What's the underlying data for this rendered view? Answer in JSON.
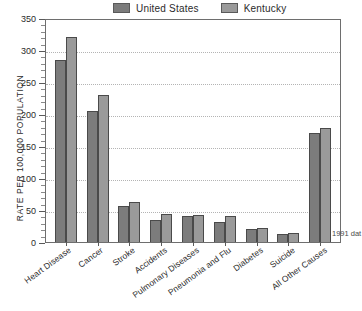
{
  "chart_data": {
    "type": "bar",
    "title": "",
    "subtitle": "",
    "xlabel": "",
    "ylabel": "RATE PER 100,000 POPULATION",
    "ylim": [
      0,
      350
    ],
    "ytick_step": 50,
    "yticks": [
      0,
      50,
      100,
      150,
      200,
      250,
      300,
      350
    ],
    "ytick_labels": [
      "0",
      "50",
      "100",
      "150",
      "200",
      "250",
      "300",
      "350"
    ],
    "grid": "horizontal-dotted",
    "legend_position": "top-center",
    "categories": [
      "Heart Disease",
      "Cancer",
      "Stroke",
      "Accidents",
      "Pulmonary Diseases",
      "Pneumonia and Flu",
      "Diabetes",
      "Suicide",
      "All Other Causes"
    ],
    "series": [
      {
        "name": "United States",
        "color": "#7c7c7c",
        "values": [
          285,
          205,
          56,
          35,
          40,
          32,
          20,
          12,
          170
        ]
      },
      {
        "name": "Kentucky",
        "color": "#9a9a9a",
        "values": [
          320,
          230,
          63,
          44,
          42,
          40,
          22,
          14,
          178
        ]
      }
    ],
    "annotations": [
      {
        "name": "source-note",
        "text": "1991 dat"
      }
    ]
  }
}
